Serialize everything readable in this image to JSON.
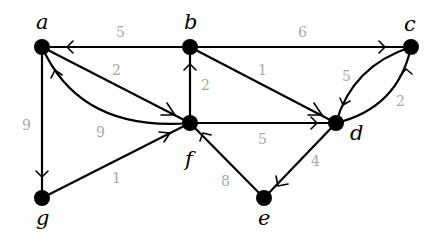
{
  "diagram": {
    "type": "weighted directed graph",
    "colors": {
      "edge": "#000000",
      "node": "#000000",
      "weight_label": "#a8a8a8"
    },
    "nodes": [
      {
        "id": "a",
        "label": "a",
        "x": 42,
        "y": 47
      },
      {
        "id": "b",
        "label": "b",
        "x": 190,
        "y": 47
      },
      {
        "id": "c",
        "label": "c",
        "x": 411,
        "y": 47
      },
      {
        "id": "d",
        "label": "d",
        "x": 336,
        "y": 123
      },
      {
        "id": "e",
        "label": "e",
        "x": 264,
        "y": 198
      },
      {
        "id": "f",
        "label": "f",
        "x": 190,
        "y": 123
      },
      {
        "id": "g",
        "label": "g",
        "x": 42,
        "y": 198
      }
    ],
    "edges": [
      {
        "from": "b",
        "to": "a",
        "weight": "5"
      },
      {
        "from": "b",
        "to": "c",
        "weight": "6"
      },
      {
        "from": "a",
        "to": "f",
        "weight": "2"
      },
      {
        "from": "f",
        "to": "b",
        "weight": "2"
      },
      {
        "from": "b",
        "to": "d",
        "weight": "1"
      },
      {
        "from": "c",
        "to": "d",
        "weight": "5"
      },
      {
        "from": "d",
        "to": "c",
        "weight": "2"
      },
      {
        "from": "f",
        "to": "a",
        "weight": "9"
      },
      {
        "from": "a",
        "to": "g",
        "weight": "9"
      },
      {
        "from": "g",
        "to": "f",
        "weight": "1"
      },
      {
        "from": "f",
        "to": "d",
        "weight": "5"
      },
      {
        "from": "d",
        "to": "e",
        "weight": "4"
      },
      {
        "from": "e",
        "to": "f",
        "weight": "8"
      }
    ]
  }
}
